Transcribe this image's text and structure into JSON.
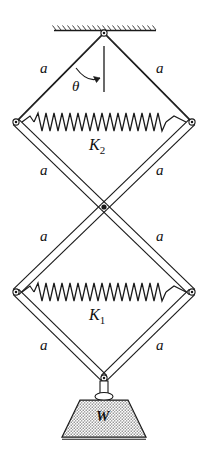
{
  "figure": {
    "background_color": "#ffffff",
    "line_color": "#1a1a1a",
    "fill_color": "#ffffff",
    "width": 208,
    "height": 449
  },
  "labels": {
    "a1": "a",
    "a2": "a",
    "a3": "a",
    "a4": "a",
    "a5": "a",
    "a6": "a",
    "a7": "a",
    "a8": "a",
    "theta": "θ",
    "k2": "K",
    "k2_sub": "2",
    "k1": "K",
    "k1_sub": "1",
    "weight": "W"
  },
  "geometry": {
    "ceiling_y": 30,
    "ceiling_x1": 54,
    "ceiling_x2": 156,
    "pivot": [
      104,
      33
    ],
    "upper_left": [
      16,
      122
    ],
    "upper_right": [
      192,
      122
    ],
    "middle": [
      104,
      207
    ],
    "lower_left": [
      16,
      292
    ],
    "lower_right": [
      192,
      292
    ],
    "bottom": [
      104,
      378
    ],
    "bar_offset": 4,
    "spring_upper_y": 122,
    "spring_lower_y": 292,
    "spring_coils": 20,
    "spring_amplitude": 9,
    "vertical_ref_x": 104,
    "vertical_ref_y1": 46,
    "vertical_ref_y2": 92,
    "theta_arc_radius": 36,
    "weight_top_y": 399,
    "weight_bottom_y": 437,
    "weight_top_half_width": 24,
    "weight_bottom_half_width": 42
  },
  "elements": {
    "ceiling_support": "hatched-ceiling",
    "top_pivot": "pin-joint",
    "middle_joint": "scissor-crossing",
    "left_joints": "pin-joint",
    "right_joints": "pin-joint",
    "spring_upper": "coil-spring",
    "spring_lower": "coil-spring",
    "weight_block": "trapezoid-weight",
    "angle_marker": "theta-arc-arrow",
    "reference_line": "vertical-dashed-line"
  }
}
